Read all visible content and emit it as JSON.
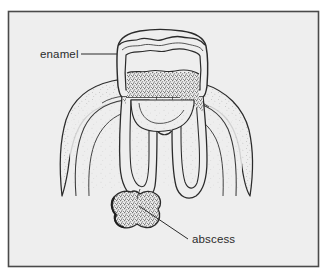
{
  "figure": {
    "style": "stippled line engraving",
    "background_color": "#ffffff",
    "panel_color": "#eeeeee",
    "frame_color": "#4a4a4a",
    "ink_color": "#2b2b2b",
    "stipple_color": "#555555"
  },
  "frame": {
    "x": 8,
    "y": 11,
    "width": 311,
    "height": 256
  },
  "labels": [
    {
      "id": "enamel",
      "text": "enamel",
      "text_x": 40,
      "text_y": 58,
      "leader_from_x": 81,
      "leader_from_y": 54,
      "leader_to_x": 117,
      "leader_to_y": 54
    },
    {
      "id": "abscess",
      "text": "abscess",
      "text_x": 192,
      "text_y": 243,
      "leader_from_x": 188,
      "leader_from_y": 239,
      "leader_to_x": 139,
      "leader_to_y": 206
    }
  ],
  "anatomy": {
    "parts": [
      {
        "id": "crown",
        "name": "crown"
      },
      {
        "id": "enamel-layer",
        "name": "enamel layer"
      },
      {
        "id": "dentin",
        "name": "dentin"
      },
      {
        "id": "pulp-chamber",
        "name": "pulp chamber"
      },
      {
        "id": "root-canal-left",
        "name": "left root canal"
      },
      {
        "id": "root-canal-right",
        "name": "right root canal"
      },
      {
        "id": "root-left",
        "name": "left root"
      },
      {
        "id": "root-right",
        "name": "right root"
      },
      {
        "id": "gum-tissue",
        "name": "gum and bone tissue"
      },
      {
        "id": "abscess-mass",
        "name": "abscess mass"
      }
    ]
  }
}
